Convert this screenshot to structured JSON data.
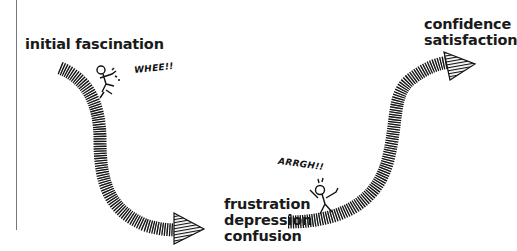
{
  "diagram": {
    "type": "change-curve-illustration",
    "labels": {
      "initial": [
        "initial fascination"
      ],
      "low": [
        "frustration",
        "depression",
        "confusion"
      ],
      "high": [
        "confidence",
        "satisfaction"
      ]
    },
    "exclamations": {
      "whee": "WHEE!!",
      "arrgh": "ARRGH!!"
    },
    "arrows": [
      {
        "name": "descending-arrow",
        "from": "initial fascination",
        "to": "frustration depression confusion"
      },
      {
        "name": "ascending-arrow",
        "from": "frustration depression confusion",
        "to": "confidence satisfaction"
      }
    ],
    "figures": [
      {
        "name": "falling-figure",
        "near": "WHEE!!"
      },
      {
        "name": "distressed-figure",
        "near": "ARRGH!!"
      }
    ],
    "colors": {
      "ink": "#111111",
      "background": "#ffffff",
      "margin_line": "#777777"
    }
  }
}
